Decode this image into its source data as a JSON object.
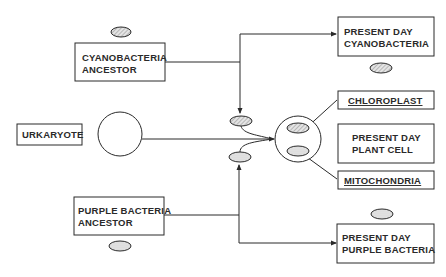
{
  "diagram": {
    "type": "endosymbiotic-theory-flow",
    "nodes": {
      "cyanobacteria_ancestor": {
        "line1": "CYANOBACTERIA",
        "line2": "ANCESTOR"
      },
      "purple_bacteria_ancestor": {
        "line1": "PURPLE BACTERIA",
        "line2": "ANCESTOR"
      },
      "urkaryote": {
        "label": "URKARYOTE"
      },
      "present_cyanobacteria": {
        "line1": "PRESENT DAY",
        "line2": "CYANOBACTERIA"
      },
      "chloroplast": {
        "label": "CHLOROPLAST"
      },
      "present_plant_cell": {
        "line1": "PRESENT DAY",
        "line2": "PLANT CELL"
      },
      "mitochondria": {
        "label": "MITOCHONDRIA"
      },
      "present_purple_bacteria": {
        "line1": "PRESENT DAY",
        "line2": "PURPLE BACTERIA"
      }
    },
    "colors": {
      "line": "#2a2a2a",
      "hatched_fill": "#c8c8c8",
      "dotted_fill": "#dcdcdc"
    }
  }
}
